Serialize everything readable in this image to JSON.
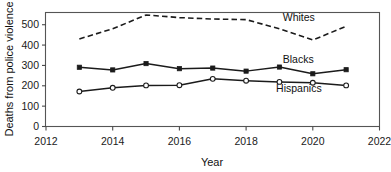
{
  "chart_data": {
    "type": "line",
    "title": "",
    "xlabel": "Year",
    "ylabel": "Deaths from police violence",
    "x": [
      2013,
      2014,
      2015,
      2016,
      2017,
      2018,
      2019,
      2020,
      2021
    ],
    "xlim": [
      2012,
      2022
    ],
    "ylim": [
      0,
      560
    ],
    "xticks": [
      2012,
      2014,
      2016,
      2018,
      2020,
      2022
    ],
    "xticklabels": [
      "2012",
      "2014",
      "2016",
      "2018",
      "2020",
      "2022"
    ],
    "yticks": [
      0,
      100,
      200,
      300,
      400,
      500
    ],
    "yticklabels": [
      "0",
      "100",
      "200",
      "300",
      "400",
      "500"
    ],
    "grid": false,
    "legend_position": "inline-right",
    "series": [
      {
        "name": "Whites",
        "values": [
          430,
          480,
          548,
          535,
          528,
          525,
          480,
          425,
          492
        ],
        "style": "dashed",
        "marker": "none",
        "color": "#1b1b1b",
        "label_x": 2019.1,
        "label_y": 520
      },
      {
        "name": "Blacks",
        "values": [
          291,
          278,
          309,
          284,
          287,
          272,
          292,
          259,
          279
        ],
        "style": "solid",
        "marker": "filled-square",
        "color": "#1b1b1b",
        "label_x": 2019.1,
        "label_y": 310
      },
      {
        "name": "Hispanics",
        "values": [
          172,
          190,
          202,
          203,
          234,
          225,
          219,
          215,
          202
        ],
        "style": "solid",
        "marker": "open-circle",
        "color": "#1b1b1b",
        "label_x": 2018.9,
        "label_y": 168
      }
    ]
  }
}
